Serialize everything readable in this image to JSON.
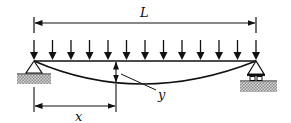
{
  "diagram": {
    "labels": {
      "span": "L",
      "position": "x",
      "deflection": "y"
    },
    "load": {
      "arrow_count": 13
    },
    "supports": {
      "left": "pin",
      "right": "roller"
    },
    "colors": {
      "stroke": "#111111",
      "hatch": "#9a9a9a",
      "background": "#ffffff"
    }
  }
}
